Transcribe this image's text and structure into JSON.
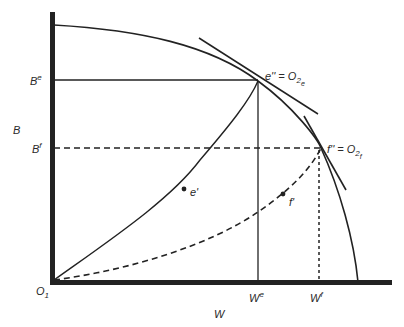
{
  "diagram": {
    "type": "edgeworth-box-contract-curves",
    "axes": {
      "origin_label": "O",
      "origin_subscript": "1",
      "x_axis_label": "W",
      "y_axis_label": "B"
    },
    "y_ticks": [
      {
        "base": "B",
        "sup": "e",
        "id": "Be"
      },
      {
        "base": "B",
        "sup": "f",
        "id": "Bf"
      }
    ],
    "x_ticks": [
      {
        "base": "W",
        "sup": "e",
        "id": "We"
      },
      {
        "base": "W",
        "sup": "f",
        "id": "Wf"
      }
    ],
    "points": [
      {
        "id": "e-double-prime",
        "label": "e'' = O",
        "sub": "2",
        "subsub": "e"
      },
      {
        "id": "f-double-prime",
        "label": "f'' = O",
        "sub": "2",
        "subsub": "f"
      },
      {
        "id": "e-prime",
        "label": "e'"
      },
      {
        "id": "f-prime",
        "label": "f'"
      }
    ],
    "curves": [
      {
        "id": "production-frontier",
        "style": "solid"
      },
      {
        "id": "contract-curve-e",
        "style": "solid"
      },
      {
        "id": "contract-curve-f",
        "style": "dashed"
      },
      {
        "id": "tangent-e",
        "style": "solid"
      },
      {
        "id": "tangent-f",
        "style": "solid"
      }
    ]
  }
}
